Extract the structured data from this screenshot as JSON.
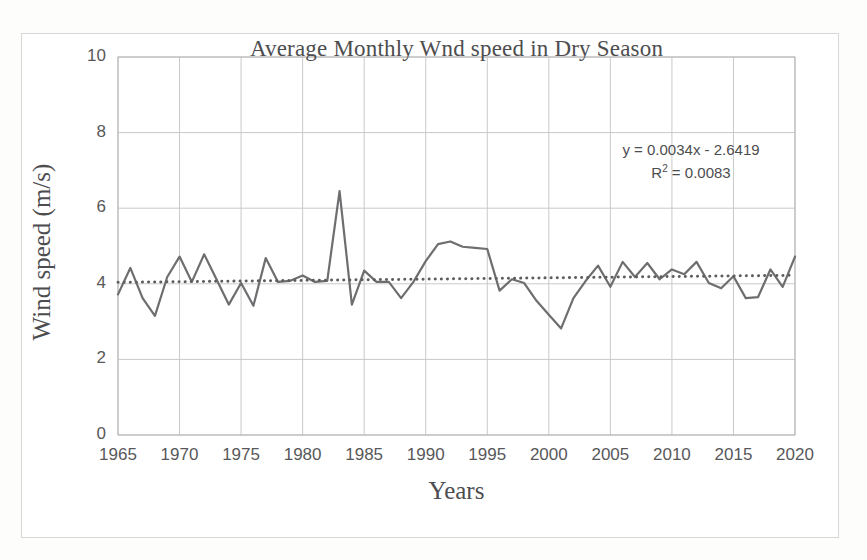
{
  "chart_data": {
    "type": "line",
    "title": "Average Monthly Wnd speed in Dry Season",
    "xlabel": "Years",
    "ylabel": "Wind speed (m/s)",
    "xlim": [
      1965,
      2020
    ],
    "ylim": [
      0,
      10
    ],
    "xticks": [
      1965,
      1970,
      1975,
      1980,
      1985,
      1990,
      1995,
      2000,
      2005,
      2010,
      2015,
      2020
    ],
    "yticks": [
      0,
      2,
      4,
      6,
      8,
      10
    ],
    "grid": true,
    "legend": "none",
    "series": [
      {
        "name": "Average monthly wind speed",
        "style": "solid",
        "color": "#6e6e70",
        "x": [
          1965,
          1966,
          1967,
          1968,
          1969,
          1970,
          1971,
          1972,
          1973,
          1974,
          1975,
          1976,
          1977,
          1978,
          1979,
          1980,
          1981,
          1982,
          1983,
          1984,
          1985,
          1986,
          1987,
          1988,
          1989,
          1990,
          1991,
          1992,
          1993,
          1994,
          1995,
          1996,
          1997,
          1998,
          1999,
          2000,
          2001,
          2002,
          2003,
          2004,
          2005,
          2006,
          2007,
          2008,
          2009,
          2010,
          2011,
          2012,
          2013,
          2014,
          2015,
          2016,
          2017,
          2018,
          2019,
          2020
        ],
        "values": [
          3.72,
          4.42,
          3.62,
          3.15,
          4.18,
          4.72,
          4.05,
          4.78,
          4.12,
          3.45,
          4.02,
          3.42,
          4.68,
          4.05,
          4.08,
          4.22,
          4.05,
          4.08,
          6.45,
          3.45,
          4.35,
          4.05,
          4.05,
          3.62,
          4.05,
          4.6,
          5.05,
          5.12,
          4.98,
          4.95,
          4.92,
          3.82,
          4.12,
          4.02,
          3.55,
          3.18,
          2.82,
          3.62,
          4.08,
          4.48,
          3.92,
          4.58,
          4.18,
          4.55,
          4.12,
          4.38,
          4.25,
          4.58,
          4.02,
          3.88,
          4.2,
          3.62,
          3.65,
          4.38,
          3.92,
          4.72
        ]
      },
      {
        "name": "Linear (Average monthly wind speed)",
        "style": "dotted",
        "color": "#5d5d5f",
        "equation_slope": 0.0034,
        "equation_intercept": -2.6419,
        "x": [
          1965,
          2020
        ],
        "values": [
          4.039,
          4.226
        ]
      }
    ],
    "annotations": {
      "equation": "y = 0.0034x - 2.6419",
      "r_squared_prefix": "R",
      "r_squared_sup": "2",
      "r_squared_value": " = 0.0083"
    }
  },
  "colors": {
    "series_line": "#6e6e70",
    "trend_line": "#5d5d5f",
    "gridline": "#c9c9c9",
    "axis": "#b5b5b5",
    "text": "#4d4d4f",
    "tick_text": "#58585a",
    "frame": "#d7d7d7",
    "plot_background": "#ffffff",
    "page_background": "#fdfdfc"
  }
}
